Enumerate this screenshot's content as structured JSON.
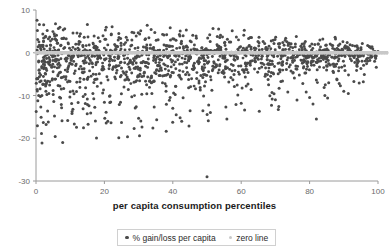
{
  "chart_data": {
    "type": "scatter",
    "title": "",
    "subtitle": "",
    "xlabel": "per capita consumption percentiles",
    "ylabel": "",
    "xlim": [
      0,
      100
    ],
    "ylim": [
      -30,
      10
    ],
    "xticks": [
      0,
      20,
      40,
      60,
      80,
      100
    ],
    "xticklabels": [
      "0",
      "20",
      "40",
      "60",
      "80",
      "100"
    ],
    "yticks": [
      10,
      0,
      -10,
      -20,
      -30
    ],
    "yticklabels": [
      "10",
      "0",
      "-10",
      "-20",
      "-30"
    ],
    "grid": false,
    "legend_position": "bottom-center",
    "series": [
      {
        "name": "% gain/loss per capita",
        "type": "scatter",
        "color": "#4a4a4a",
        "marker": "circle",
        "marker_size": 2.6,
        "n_points": 1100,
        "description": "Dense cloud of per-capita gain/loss values across consumption percentiles; concentrated between +4 and -8, tapering toward zero at the highest percentiles, with sparse negative outliers down to -29.",
        "points": [
          [
            0.3,
            7.6
          ],
          [
            0.4,
            5.2
          ],
          [
            0.5,
            3.1
          ],
          [
            0.6,
            1.4
          ],
          [
            0.7,
            0.2
          ],
          [
            0.8,
            -1.9
          ],
          [
            0.9,
            -4.1
          ],
          [
            1.0,
            -5.6
          ],
          [
            1.1,
            -6.8
          ],
          [
            1.2,
            -8.4
          ],
          [
            1.3,
            -10.2
          ],
          [
            1.4,
            -12.7
          ],
          [
            1.5,
            -15.1
          ],
          [
            1.6,
            -18.9
          ],
          [
            1.7,
            -3.2
          ],
          [
            2.0,
            4.4
          ],
          [
            2.2,
            2.6
          ],
          [
            2.4,
            0.9
          ],
          [
            2.6,
            -2.2
          ],
          [
            2.8,
            -5.0
          ],
          [
            3.0,
            -7.3
          ],
          [
            3.2,
            -9.8
          ],
          [
            3.4,
            -13.6
          ],
          [
            3.6,
            -16.2
          ],
          [
            3.8,
            -1.1
          ],
          [
            4.0,
            3.7
          ],
          [
            4.2,
            1.8
          ],
          [
            4.4,
            -0.4
          ],
          [
            4.6,
            -3.4
          ],
          [
            4.8,
            -6.1
          ],
          [
            5.0,
            -8.8
          ],
          [
            5.2,
            -11.4
          ],
          [
            5.4,
            -14.8
          ],
          [
            5.6,
            -19.6
          ],
          [
            5.8,
            -2.0
          ],
          [
            6.0,
            4.1
          ],
          [
            6.2,
            2.2
          ],
          [
            6.4,
            0.5
          ],
          [
            6.6,
            -1.7
          ],
          [
            6.8,
            -4.7
          ],
          [
            7.0,
            -7.8
          ],
          [
            7.2,
            -10.6
          ],
          [
            7.4,
            -12.1
          ],
          [
            7.6,
            -15.9
          ],
          [
            7.8,
            -21.0
          ],
          [
            8.0,
            3.3
          ],
          [
            8.4,
            1.2
          ],
          [
            8.8,
            -1.2
          ],
          [
            9.2,
            -4.4
          ],
          [
            9.6,
            -6.6
          ],
          [
            10.0,
            -9.1
          ],
          [
            10.4,
            -11.9
          ],
          [
            10.8,
            -13.2
          ],
          [
            11.2,
            -16.7
          ],
          [
            11.6,
            -3.0
          ],
          [
            12.0,
            4.6
          ],
          [
            12.5,
            2.0
          ],
          [
            13.0,
            -0.7
          ],
          [
            13.5,
            -3.8
          ],
          [
            14.0,
            -6.2
          ],
          [
            14.5,
            -8.2
          ],
          [
            15.0,
            -10.8
          ],
          [
            15.5,
            -12.4
          ],
          [
            16.0,
            -14.1
          ],
          [
            16.5,
            -2.5
          ],
          [
            17.0,
            3.9
          ],
          [
            17.5,
            1.5
          ],
          [
            18.0,
            -1.4
          ],
          [
            18.5,
            -4.9
          ],
          [
            19.0,
            -7.1
          ],
          [
            19.5,
            -9.4
          ],
          [
            20.0,
            -11.6
          ],
          [
            20.5,
            -13.9
          ],
          [
            21.0,
            -16.0
          ],
          [
            21.5,
            -2.8
          ],
          [
            22.0,
            4.2
          ],
          [
            23.0,
            1.9
          ],
          [
            24.0,
            -0.9
          ],
          [
            25.0,
            -3.6
          ],
          [
            26.0,
            -6.4
          ],
          [
            27.0,
            -8.6
          ],
          [
            28.0,
            -10.3
          ],
          [
            29.0,
            -12.9
          ],
          [
            30.0,
            -15.3
          ],
          [
            31.0,
            -17.4
          ],
          [
            32.0,
            -2.3
          ],
          [
            33.0,
            3.5
          ],
          [
            34.0,
            1.0
          ],
          [
            35.0,
            -1.6
          ],
          [
            36.0,
            -4.2
          ],
          [
            37.0,
            -7.0
          ],
          [
            38.0,
            -9.0
          ],
          [
            39.0,
            -11.1
          ],
          [
            40.0,
            -13.0
          ],
          [
            41.0,
            -14.5
          ],
          [
            42.0,
            -2.6
          ],
          [
            43.0,
            4.0
          ],
          [
            44.0,
            1.6
          ],
          [
            45.0,
            -1.0
          ],
          [
            46.0,
            -3.9
          ],
          [
            47.0,
            -6.0
          ],
          [
            48.0,
            -8.1
          ],
          [
            49.0,
            -10.1
          ],
          [
            50.0,
            -29.0
          ],
          [
            50.5,
            -12.2
          ],
          [
            51.0,
            -14.0
          ],
          [
            52.0,
            -2.1
          ],
          [
            53.0,
            3.8
          ],
          [
            54.0,
            1.3
          ],
          [
            55.0,
            -1.3
          ],
          [
            56.0,
            -3.5
          ],
          [
            57.0,
            -5.8
          ],
          [
            58.0,
            -7.9
          ],
          [
            59.0,
            -9.9
          ],
          [
            60.0,
            -11.8
          ],
          [
            61.0,
            -13.4
          ],
          [
            62.0,
            -2.4
          ],
          [
            63.0,
            3.6
          ],
          [
            64.0,
            1.1
          ],
          [
            65.0,
            -1.5
          ],
          [
            66.0,
            -3.3
          ],
          [
            67.0,
            -5.5
          ],
          [
            68.0,
            -7.5
          ],
          [
            69.0,
            -9.3
          ],
          [
            70.0,
            -11.0
          ],
          [
            71.0,
            -12.6
          ],
          [
            72.0,
            -2.7
          ],
          [
            73.0,
            3.4
          ],
          [
            74.0,
            0.8
          ],
          [
            75.0,
            -1.8
          ],
          [
            76.0,
            -3.1
          ],
          [
            77.0,
            -5.2
          ],
          [
            78.0,
            -7.2
          ],
          [
            79.0,
            -9.2
          ],
          [
            80.0,
            -10.5
          ],
          [
            81.0,
            -12.0
          ],
          [
            82.0,
            -15.5
          ],
          [
            83.0,
            3.0
          ],
          [
            84.0,
            0.6
          ],
          [
            85.0,
            -1.4
          ],
          [
            86.0,
            -2.9
          ],
          [
            87.0,
            -4.6
          ],
          [
            88.0,
            -6.3
          ],
          [
            89.0,
            -7.7
          ],
          [
            90.0,
            -9.0
          ],
          [
            91.0,
            2.4
          ],
          [
            92.0,
            0.4
          ],
          [
            93.0,
            -1.1
          ],
          [
            94.0,
            -2.4
          ],
          [
            95.0,
            -3.7
          ],
          [
            96.0,
            -5.1
          ],
          [
            97.0,
            1.7
          ],
          [
            98.0,
            -0.5
          ],
          [
            99.0,
            -2.0
          ],
          [
            99.5,
            -3.4
          ],
          [
            100.0,
            0.3
          ]
        ]
      },
      {
        "name": "zero line",
        "type": "line",
        "color": "#c8c8c8",
        "marker": "circle",
        "y_value": 0,
        "description": "Horizontal reference line at y = 0 drawn as a thick light gray band of markers."
      }
    ],
    "annotations": [
      {
        "text": "extreme negative outlier",
        "x": 50,
        "y": -29
      }
    ]
  },
  "legend": {
    "entries": [
      {
        "label": "% gain/loss per capita",
        "color": "#4a4a4a"
      },
      {
        "label": "zero line",
        "color": "#c8c8c8"
      }
    ]
  },
  "axes": {
    "x_title": "per capita consumption percentiles"
  }
}
